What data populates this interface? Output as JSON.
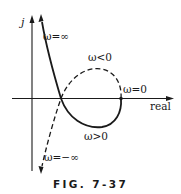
{
  "figure": {
    "caption": "FIG. 7-37",
    "axes": {
      "vertical_label": "j",
      "horizontal_label": "real"
    },
    "annotations": {
      "omega_inf": "ω=∞",
      "omega_neg": "ω<0",
      "omega_zero": "ω=0",
      "omega_pos": "ω>0",
      "omega_neg_inf": "ω=−∞"
    },
    "curves": [
      {
        "name": "positive-frequency-branch",
        "style": "solid",
        "from": "ω=∞",
        "to": "ω=0"
      },
      {
        "name": "negative-frequency-branch",
        "style": "dashed",
        "from": "ω=0",
        "to": "ω=−∞"
      }
    ],
    "colors": {
      "ink": "#1a1a1a",
      "background": "#ffffff"
    }
  }
}
